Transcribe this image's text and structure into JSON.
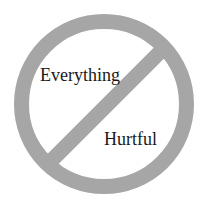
{
  "symbol": {
    "name": "prohibition-sign",
    "ring_color": "#a6a6a6",
    "background_color": "#ffffff",
    "text_color": "#1a1a1a"
  },
  "labels": {
    "top": "Everything",
    "bottom": "Hurtful"
  }
}
